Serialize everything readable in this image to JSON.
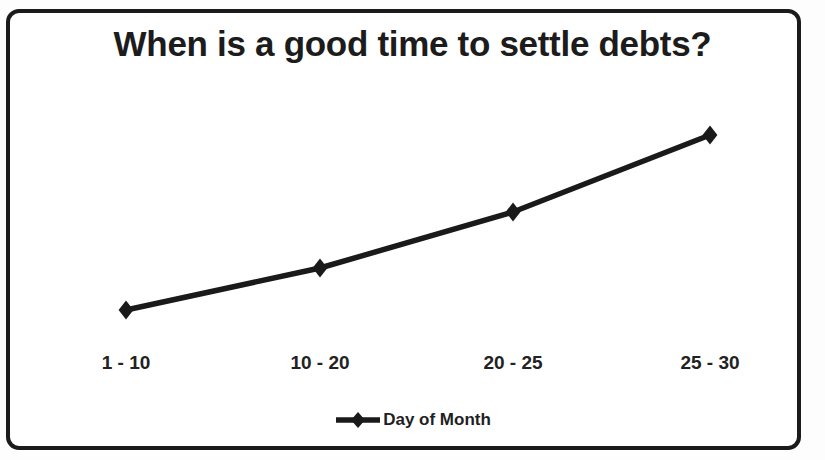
{
  "chart_data": {
    "type": "line",
    "title": "When is a good time to settle debts?",
    "xlabel": "",
    "ylabel": "",
    "categories": [
      "1 - 10",
      "10 - 20",
      "20 - 25",
      "25 - 30"
    ],
    "series": [
      {
        "name": "Day of Month",
        "values": [
          25,
          45,
          65,
          90
        ],
        "color": "#1a1a1a",
        "marker": "diamond"
      }
    ],
    "ylim": [
      0,
      100
    ],
    "grid": false,
    "y_axis_visible": false,
    "x_axis_line_visible": false,
    "legend": {
      "position": "bottom",
      "entries": [
        "Day of Month"
      ]
    },
    "pixel_points": [
      {
        "category": "1 - 10",
        "x": 126,
        "y": 310
      },
      {
        "category": "10 - 20",
        "x": 320,
        "y": 268
      },
      {
        "category": "20 - 25",
        "x": 513,
        "y": 212
      },
      {
        "category": "25 - 30",
        "x": 710,
        "y": 135
      }
    ]
  },
  "frame": {
    "border_color": "#1b1b1b",
    "background_color": "#ffffff"
  }
}
